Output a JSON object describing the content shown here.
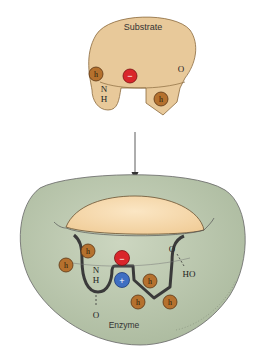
{
  "diagram": {
    "type": "enzyme-substrate binding",
    "substrate": {
      "label": "Substrate",
      "groups": {
        "hydrophobic_1": "h",
        "hydrophobic_2": "h",
        "charge": "−",
        "n_label": "N",
        "h_label": "H",
        "o_label": "O"
      }
    },
    "enzyme": {
      "label": "Enzyme",
      "groups": {
        "hydrophobic": [
          "h",
          "h",
          "h",
          "h",
          "h",
          "h"
        ],
        "negative_charge": "−",
        "positive_charge": "+",
        "n_label": "N",
        "h_label": "H",
        "o_label_bottom": "O",
        "o_label_top": "O",
        "ho_label": "HO"
      }
    },
    "colors": {
      "substrate_fill": "#e8c99a",
      "enzyme_fill": "#c4cfb7",
      "hydrophobic_fill": "#b5712e",
      "negative_fill": "#d9262b",
      "positive_fill": "#3f6fc2",
      "outline": "#3a3a3a"
    }
  }
}
